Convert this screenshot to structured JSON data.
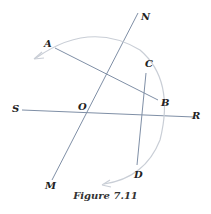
{
  "figure": {
    "caption": "Figure 7.11",
    "labels": {
      "N": "N",
      "A": "A",
      "C": "C",
      "B": "B",
      "S": "S",
      "O": "O",
      "R": "R",
      "M": "M",
      "D": "D"
    },
    "colors": {
      "line": "#7f8fa6",
      "arc": "#c9ced6",
      "text": "#222222"
    }
  }
}
